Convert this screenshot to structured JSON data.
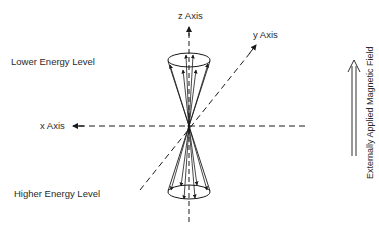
{
  "figure": {
    "clipped_caption": "",
    "labels": {
      "z_axis": "z Axis",
      "y_axis": "y Axis",
      "x_axis": "x Axis",
      "lower_energy": "Lower Energy Level",
      "higher_energy": "Higher Energy Level",
      "field": "Externally Applied Magnetic Field"
    },
    "colors": {
      "ink": "#1a1a1a",
      "background": "#ffffff"
    }
  }
}
